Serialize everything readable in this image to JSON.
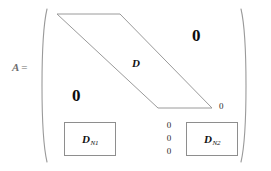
{
  "figure": {
    "type": "matrix-structure-diagram"
  },
  "equation": {
    "variable": "A",
    "equals": "="
  },
  "matrix": {
    "left_bracket": "(",
    "right_bracket": ")",
    "band_label": "D",
    "zero_upper_right": "0",
    "zero_lower_left": "0",
    "zero_band_edge": "0",
    "zero_column": [
      "0",
      "0",
      "0"
    ],
    "blocks": [
      {
        "id": "n1",
        "symbol": "D",
        "subscript": "N1"
      },
      {
        "id": "n2",
        "symbol": "D",
        "subscript": "N2"
      }
    ]
  },
  "colors": {
    "stroke": "#8e8e8e",
    "text": "#111111",
    "label_gray": "#6d6d6d",
    "background": "#ffffff"
  }
}
